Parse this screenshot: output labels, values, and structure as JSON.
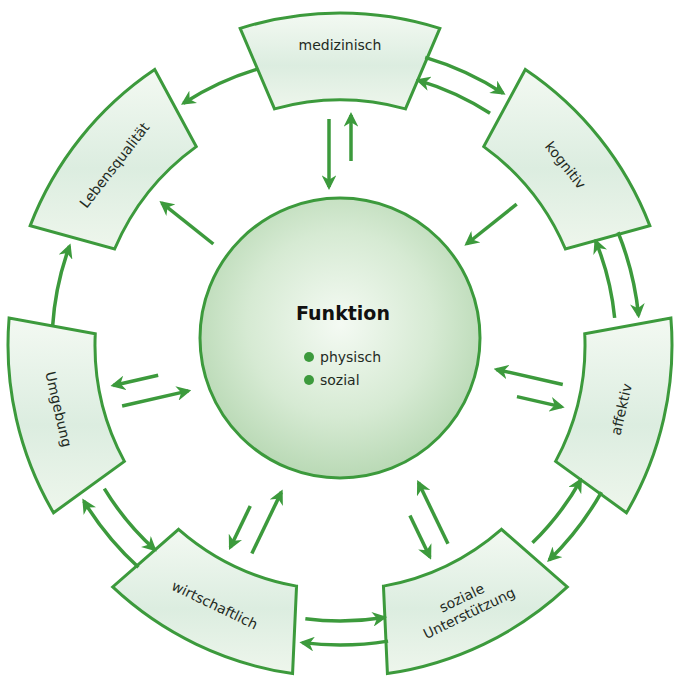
{
  "diagram": {
    "center": {
      "title": "Funktion",
      "items": [
        "physisch",
        "sozial"
      ]
    },
    "segments": [
      {
        "id": "medizinisch",
        "label": "medizinisch",
        "lines": [
          "medizinisch"
        ]
      },
      {
        "id": "kognitiv",
        "label": "kognitiv",
        "lines": [
          "kognitiv"
        ]
      },
      {
        "id": "affektiv",
        "label": "affektiv",
        "lines": [
          "affektiv"
        ]
      },
      {
        "id": "soziale-unterstuetzung",
        "label": "soziale Unterstützung",
        "lines": [
          "soziale",
          "Unterstützung"
        ]
      },
      {
        "id": "wirtschaftlich",
        "label": "wirtschaftlich",
        "lines": [
          "wirtschaftlich"
        ]
      },
      {
        "id": "umgebung",
        "label": "Umgebung",
        "lines": [
          "Umgebung"
        ]
      },
      {
        "id": "lebensqualitaet",
        "label": "Lebensqualität",
        "lines": [
          "Lebensqualität"
        ]
      }
    ],
    "ring_arrows": [
      {
        "from": "medizinisch",
        "to": "kognitiv",
        "bidirectional": true
      },
      {
        "from": "kognitiv",
        "to": "affektiv",
        "bidirectional": true
      },
      {
        "from": "affektiv",
        "to": "soziale-unterstuetzung",
        "bidirectional": true
      },
      {
        "from": "soziale-unterstuetzung",
        "to": "wirtschaftlich",
        "bidirectional": true
      },
      {
        "from": "wirtschaftlich",
        "to": "umgebung",
        "bidirectional": true
      },
      {
        "from": "umgebung",
        "to": "lebensqualitaet",
        "bidirectional": false
      },
      {
        "from": "medizinisch",
        "to": "lebensqualitaet",
        "bidirectional": false
      }
    ],
    "center_arrows": [
      {
        "segment": "medizinisch",
        "direction": "both"
      },
      {
        "segment": "kognitiv",
        "direction": "to-center"
      },
      {
        "segment": "affektiv",
        "direction": "both"
      },
      {
        "segment": "soziale-unterstuetzung",
        "direction": "both"
      },
      {
        "segment": "wirtschaftlich",
        "direction": "both"
      },
      {
        "segment": "umgebung",
        "direction": "both"
      },
      {
        "segment": "lebensqualitaet",
        "direction": "from-center"
      }
    ],
    "colors": {
      "stroke": "#3c9a3c",
      "fill_light": "#f2f8f1",
      "fill_dark": "#c5e0c2",
      "center_fill": "#cfe6cc",
      "bullet": "#3c9a3c"
    }
  }
}
